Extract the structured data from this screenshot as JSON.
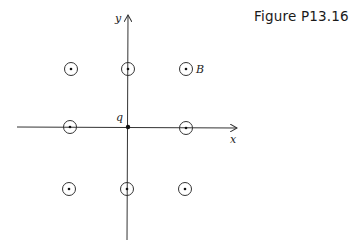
{
  "figure": {
    "title": "Figure P13.16"
  },
  "axes": {
    "x_label": "x",
    "y_label": "y",
    "origin_label": "q"
  },
  "field": {
    "label": "B",
    "symbol": "dot-in-circle (out of page)",
    "grid": [
      {
        "row": "top",
        "col": "left"
      },
      {
        "row": "top",
        "col": "center"
      },
      {
        "row": "top",
        "col": "right"
      },
      {
        "row": "middle",
        "col": "left"
      },
      {
        "row": "middle",
        "col": "right"
      },
      {
        "row": "bottom",
        "col": "left"
      },
      {
        "row": "bottom",
        "col": "center"
      },
      {
        "row": "bottom",
        "col": "right"
      }
    ]
  },
  "colors": {
    "line": "#333333",
    "text": "#1a1a1a"
  }
}
